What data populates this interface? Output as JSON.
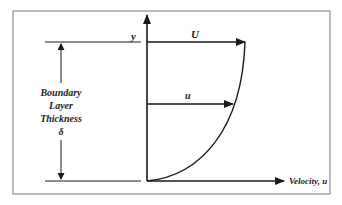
{
  "diagram": {
    "labels": {
      "y_axis": "y",
      "free_stream": "U",
      "local_velocity": "u",
      "x_axis": "Velocity, u",
      "thickness_line1": "Boundary",
      "thickness_line2": "Layer",
      "thickness_line3": "Thickness",
      "thickness_symbol": "δ"
    },
    "colors": {
      "line": "#1a1a1a",
      "border": "#777777",
      "background": "#ffffff"
    }
  }
}
